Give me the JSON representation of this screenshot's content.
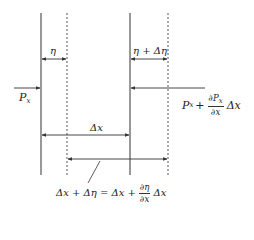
{
  "diagram": {
    "type": "force-balance-schematic",
    "colors": {
      "line": "#333333",
      "background": "#ffffff"
    },
    "lines": [
      {
        "id": "solid-left",
        "style": "solid",
        "x": 41
      },
      {
        "id": "dotted-left",
        "style": "dotted",
        "x": 67
      },
      {
        "id": "solid-right",
        "style": "solid",
        "x": 130
      },
      {
        "id": "dotted-right",
        "style": "dotted",
        "x": 168
      }
    ],
    "labels": {
      "eta": "η",
      "eta_plus_delta_eta": "η + Δη",
      "px": {
        "base": "P",
        "sub": "x"
      },
      "px_plus": {
        "base": "P",
        "sub": "x",
        "plus": "+",
        "frac_num": "∂P",
        "frac_num_sub": "x",
        "frac_den": "∂x",
        "tail": "Δx"
      },
      "delta_x": "Δx",
      "bottom_equation": {
        "lhs": "Δx + Δη = Δx +",
        "frac_num": "∂η",
        "frac_den": "∂x",
        "tail": "Δx"
      }
    }
  }
}
